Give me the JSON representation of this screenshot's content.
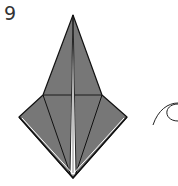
{
  "diagram": {
    "step_number": "9",
    "colors": {
      "paper_fill": "#777777",
      "line": "#111111",
      "background": "#ffffff",
      "highlight": "#ffffff"
    },
    "vertices": {
      "top": [
        73,
        15
      ],
      "left_shoulder": [
        43,
        95
      ],
      "right_shoulder": [
        102,
        95
      ],
      "left_tip": [
        19,
        117
      ],
      "right_tip": [
        127,
        117
      ],
      "bottom": [
        73,
        178
      ]
    },
    "symbols": [
      {
        "type": "arrow-curve",
        "position": [
          160,
          115
        ]
      }
    ]
  }
}
